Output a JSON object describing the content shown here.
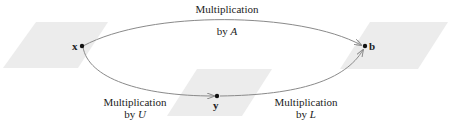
{
  "colors": {
    "plane_fill": "#ececec",
    "arrow_stroke": "#8a8a8a",
    "point_fill": "#111111",
    "text": "#222222"
  },
  "points": {
    "x": {
      "label": "x"
    },
    "y": {
      "label": "y"
    },
    "b": {
      "label": "b"
    }
  },
  "arrows": {
    "top": {
      "line1": "Multiplication",
      "line2_prefix": "by ",
      "line2_var": "A"
    },
    "lower_left": {
      "line1": "Multiplication",
      "line2_prefix": "by ",
      "line2_var": "U"
    },
    "lower_right": {
      "line1": "Multiplication",
      "line2_prefix": "by ",
      "line2_var": "L"
    }
  }
}
